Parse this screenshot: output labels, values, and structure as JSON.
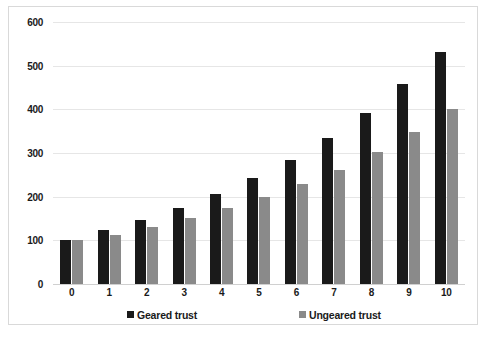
{
  "chart_data": {
    "type": "bar",
    "title": "",
    "subtitle": "",
    "xlabel": "",
    "ylabel": "",
    "categories": [
      "0",
      "1",
      "2",
      "3",
      "4",
      "5",
      "6",
      "7",
      "8",
      "9",
      "10"
    ],
    "series": [
      {
        "name": "Geared trust",
        "color": "#1a1a1a",
        "values": [
          100,
          123,
          146,
          174,
          206,
          242,
          285,
          335,
          392,
          457,
          531
        ]
      },
      {
        "name": "Ungeared trust",
        "color": "#8a8a8a",
        "values": [
          100,
          113,
          131,
          152,
          174,
          199,
          228,
          262,
          302,
          347,
          400
        ]
      }
    ],
    "ylim": [
      0,
      600
    ],
    "ytick_values": [
      600,
      500,
      400,
      300,
      200,
      100,
      0
    ],
    "ytick_labels": [
      "600",
      "500",
      "400",
      "300",
      "200",
      "100",
      "0"
    ],
    "grid": true,
    "grid_axis": "y",
    "legend_position": "bottom",
    "legend": [
      "Geared trust",
      "Ungeared trust"
    ],
    "annotations": []
  },
  "frame": {
    "border_color": "#d9d9d9",
    "background": "#ffffff"
  }
}
